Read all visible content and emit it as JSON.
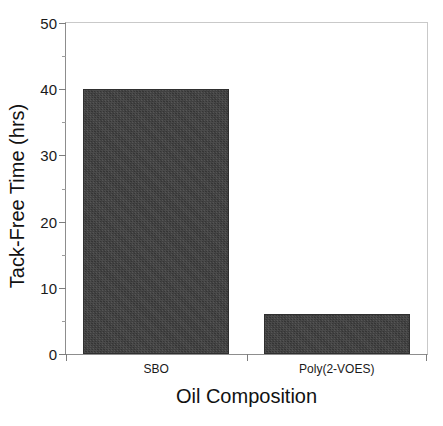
{
  "chart_data": {
    "type": "bar",
    "title": "",
    "categories": [
      "SBO",
      "Poly(2-VOES)"
    ],
    "values": [
      40,
      6
    ],
    "xlabel": "Oil Composition",
    "ylabel": "Tack-Free Time (hrs)",
    "ylim": [
      0,
      50
    ],
    "ytick_labels": [
      "0",
      "10",
      "20",
      "30",
      "40",
      "50"
    ],
    "ytick_values": [
      0,
      10,
      20,
      30,
      40,
      50
    ],
    "yminor_values": [
      5,
      15,
      25,
      35,
      45
    ],
    "grid": false,
    "legend": false,
    "bar_color": "#3a3a3a",
    "background_color": "#ffffff",
    "axis_color": "#8d8d8d"
  }
}
